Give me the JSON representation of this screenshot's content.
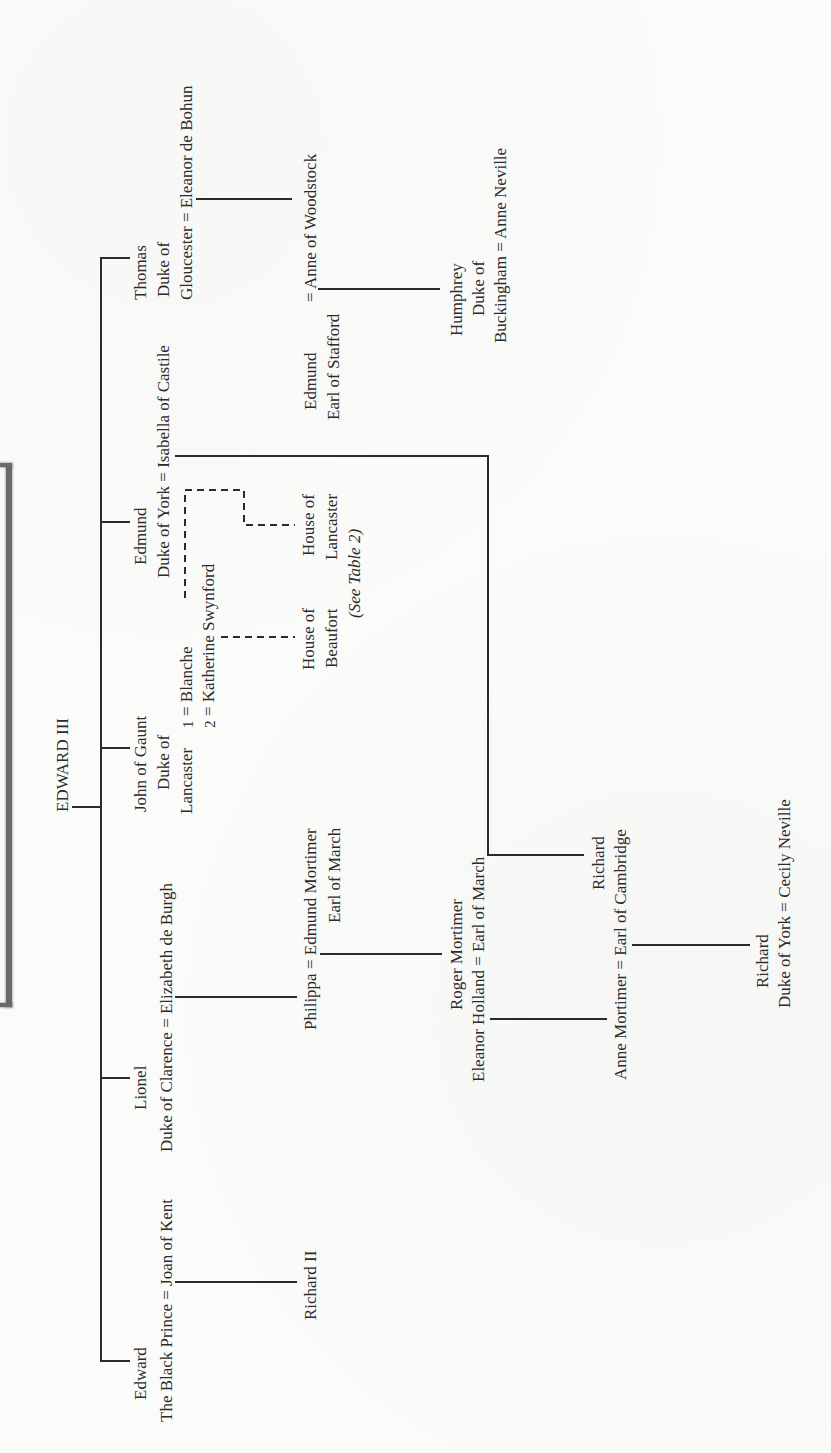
{
  "diagram": {
    "type": "genealogy-tree",
    "orientation": "rotated-90-ccw",
    "root": "EDWARD III",
    "reference_note": "(See Table 2)",
    "people": {
      "root": "EDWARD III",
      "edward_line1": "Edward",
      "edward_line2": "The Black Prince = Joan of Kent",
      "richard_ii": "Richard II",
      "lionel_line1": "Lionel",
      "lionel_line2": "Duke of Clarence = Elizabeth de Burgh",
      "philippa_line1": "Philippa = Edmund Mortimer",
      "philippa_line2": "Earl of March",
      "roger_line1": "Roger Mortimer",
      "roger_line2": "Eleanor Holland = Earl of March",
      "anne_line1": "Anne Mortimer = Earl of Cambridge",
      "richard_cambridge_line1": "Richard",
      "richard_york_line1": "Richard",
      "richard_york_line2": "Duke of York = Cecily Neville",
      "john_line1": "John of Gaunt",
      "john_line2": "Duke of",
      "john_line3": "Lancaster",
      "john_marriage1_num": "1",
      "john_marriage1": "= Blanche",
      "john_marriage2_num": "2",
      "john_marriage2": "= Katherine Swynford",
      "beaufort_line1": "House of",
      "beaufort_line2": "Beaufort",
      "lancaster_line1": "House of",
      "lancaster_line2": "Lancaster",
      "see_table": "(See Table 2)",
      "edmund_line1": "Edmund",
      "edmund_line2": "Duke of York = Isabella of Castile",
      "thomas_line1": "Thomas",
      "thomas_line2": "Duke of",
      "thomas_line3": "Gloucester = Eleanor de Bohun",
      "stafford_line1": "Edmund",
      "stafford_line2": "Earl of Stafford",
      "stafford_spouse": "= Anne of Woodstock",
      "humphrey_line1": "Humphrey",
      "humphrey_line2": "Duke of",
      "humphrey_line3": "Buckingham = Anne Neville"
    },
    "relationships": [
      {
        "parent": "Edward III",
        "children": [
          "Edward the Black Prince",
          "Lionel Duke of Clarence",
          "John of Gaunt Duke of Lancaster",
          "Edmund Duke of York",
          "Thomas Duke of Gloucester"
        ]
      },
      {
        "couple": [
          "Edward the Black Prince",
          "Joan of Kent"
        ],
        "children": [
          "Richard II"
        ]
      },
      {
        "couple": [
          "Lionel Duke of Clarence",
          "Elizabeth de Burgh"
        ],
        "children": [
          "Philippa"
        ]
      },
      {
        "couple": [
          "Philippa",
          "Edmund Mortimer Earl of March"
        ],
        "children": [
          "Roger Mortimer Earl of March"
        ]
      },
      {
        "couple": [
          "Eleanor Holland",
          "Roger Mortimer Earl of March"
        ],
        "children": [
          "Anne Mortimer"
        ]
      },
      {
        "couple": [
          "John of Gaunt",
          "Blanche"
        ],
        "children": [
          "House of Lancaster"
        ],
        "line": "dashed"
      },
      {
        "couple": [
          "John of Gaunt",
          "Katherine Swynford"
        ],
        "children": [
          "House of Beaufort"
        ],
        "line": "dashed"
      },
      {
        "couple": [
          "Edmund Duke of York",
          "Isabella of Castile"
        ],
        "children": [
          "Richard Earl of Cambridge"
        ]
      },
      {
        "couple": [
          "Anne Mortimer",
          "Richard Earl of Cambridge"
        ],
        "children": [
          "Richard Duke of York"
        ]
      },
      {
        "couple": [
          "Richard Duke of York",
          "Cecily Neville"
        ],
        "children": []
      },
      {
        "couple": [
          "Thomas Duke of Gloucester",
          "Eleanor de Bohun"
        ],
        "children": [
          "Anne of Woodstock"
        ]
      },
      {
        "couple": [
          "Edmund Earl of Stafford",
          "Anne of Woodstock"
        ],
        "children": [
          "Humphrey Duke of Buckingham"
        ]
      },
      {
        "couple": [
          "Humphrey Duke of Buckingham",
          "Anne Neville"
        ],
        "children": []
      }
    ],
    "colors": {
      "ink": "#2b2b2b",
      "paper": "#fbfbfa",
      "box_edge": "#6a6a6a"
    }
  }
}
